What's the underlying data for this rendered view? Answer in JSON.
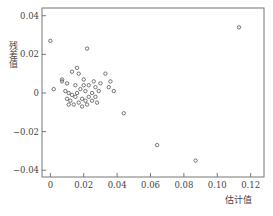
{
  "chart_data": {
    "type": "scatter",
    "title": "",
    "xlabel": "估计值",
    "ylabel": "残差值",
    "xlim": [
      -0.005,
      0.128
    ],
    "ylim": [
      -0.0435,
      0.044
    ],
    "xticks": [
      0,
      0.02,
      0.04,
      0.06,
      0.08,
      0.1,
      0.12
    ],
    "xtick_labels": [
      "0",
      "0.02",
      "0.04",
      "0.06",
      "0.08",
      "0.10",
      "0.12"
    ],
    "yticks": [
      0.04,
      0.02,
      0,
      -0.02,
      -0.04
    ],
    "ytick_labels": [
      "0.04",
      "0.02",
      "0",
      "−0.02",
      "−0.04"
    ],
    "grid": false,
    "legend": "none",
    "marker": "open-circle",
    "points": [
      {
        "x": 0.0,
        "y": 0.027
      },
      {
        "x": 0.022,
        "y": 0.023
      },
      {
        "x": 0.113,
        "y": 0.034
      },
      {
        "x": 0.002,
        "y": 0.002
      },
      {
        "x": 0.007,
        "y": 0.006
      },
      {
        "x": 0.007,
        "y": 0.007
      },
      {
        "x": 0.01,
        "y": 0.005
      },
      {
        "x": 0.013,
        "y": 0.011
      },
      {
        "x": 0.016,
        "y": 0.013
      },
      {
        "x": 0.017,
        "y": 0.01
      },
      {
        "x": 0.02,
        "y": 0.007
      },
      {
        "x": 0.015,
        "y": 0.004
      },
      {
        "x": 0.009,
        "y": 0.001
      },
      {
        "x": 0.011,
        "y": 0.0
      },
      {
        "x": 0.013,
        "y": -0.001
      },
      {
        "x": 0.016,
        "y": 0.0
      },
      {
        "x": 0.018,
        "y": 0.002
      },
      {
        "x": 0.021,
        "y": 0.001
      },
      {
        "x": 0.023,
        "y": 0.004
      },
      {
        "x": 0.026,
        "y": 0.006
      },
      {
        "x": 0.027,
        "y": 0.003
      },
      {
        "x": 0.029,
        "y": 0.001
      },
      {
        "x": 0.025,
        "y": 0.0
      },
      {
        "x": 0.033,
        "y": 0.01
      },
      {
        "x": 0.036,
        "y": 0.006
      },
      {
        "x": 0.038,
        "y": 0.001
      },
      {
        "x": 0.035,
        "y": 0.003
      },
      {
        "x": 0.03,
        "y": 0.005
      },
      {
        "x": 0.01,
        "y": -0.003
      },
      {
        "x": 0.012,
        "y": -0.004
      },
      {
        "x": 0.015,
        "y": -0.002
      },
      {
        "x": 0.017,
        "y": -0.005
      },
      {
        "x": 0.019,
        "y": -0.003
      },
      {
        "x": 0.021,
        "y": -0.004
      },
      {
        "x": 0.023,
        "y": -0.002
      },
      {
        "x": 0.022,
        "y": -0.006
      },
      {
        "x": 0.025,
        "y": -0.004
      },
      {
        "x": 0.027,
        "y": -0.002
      },
      {
        "x": 0.014,
        "y": -0.006
      },
      {
        "x": 0.019,
        "y": -0.007
      },
      {
        "x": 0.011,
        "y": -0.006
      },
      {
        "x": 0.028,
        "y": -0.005
      },
      {
        "x": 0.02,
        "y": 0.004
      },
      {
        "x": 0.044,
        "y": -0.0105
      },
      {
        "x": 0.064,
        "y": -0.027
      },
      {
        "x": 0.087,
        "y": -0.035
      }
    ]
  }
}
